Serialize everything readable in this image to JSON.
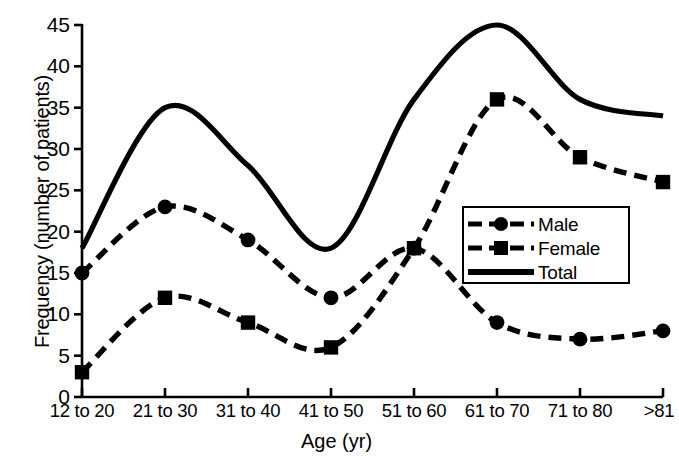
{
  "chart_data": {
    "type": "line",
    "title": "",
    "xlabel": "Age (yr)",
    "ylabel": "Frequency (number of patients)",
    "categories": [
      "12 to 20",
      "21 to 30",
      "31 to 40",
      "41 to 50",
      "51 to 60",
      "61 to 70",
      "71 to 80",
      ">81"
    ],
    "series": [
      {
        "name": "Male",
        "marker": "circle",
        "line": "dashed",
        "values": [
          15,
          23,
          19,
          12,
          18,
          9,
          7,
          8
        ]
      },
      {
        "name": "Female",
        "marker": "square",
        "line": "dashed",
        "values": [
          3,
          12,
          9,
          6,
          18,
          36,
          29,
          26
        ]
      },
      {
        "name": "Total",
        "marker": "none",
        "line": "solid",
        "values": [
          18,
          35,
          28,
          18,
          36,
          45,
          36,
          34
        ]
      }
    ],
    "ylim": [
      0,
      45
    ],
    "y_ticks": [
      "0",
      "5",
      "10",
      "15",
      "20",
      "25",
      "30",
      "35",
      "40",
      "45"
    ],
    "grid": false,
    "legend_position": "center-right",
    "line_color": "#000000"
  },
  "legend": {
    "items": [
      {
        "label": "Male"
      },
      {
        "label": "Female"
      },
      {
        "label": "Total"
      }
    ]
  },
  "caption": {
    "text": ""
  }
}
